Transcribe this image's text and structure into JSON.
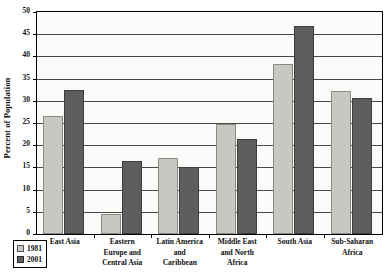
{
  "chart_data": {
    "type": "bar",
    "title": "",
    "xlabel": "",
    "ylabel": "Percent of Population",
    "ylim": [
      0,
      50
    ],
    "ytick_step": 5,
    "yticks": [
      0,
      5,
      10,
      15,
      20,
      25,
      30,
      35,
      40,
      45,
      50
    ],
    "ytick_labels": [
      "0",
      "5",
      "10",
      "15",
      "20",
      "25",
      "30",
      "35",
      "40",
      "45",
      "50"
    ],
    "grid": true,
    "legend_position": "bottom-left",
    "categories": [
      "East Asia",
      "Eastern Europe and Central Asia",
      "Latin America and Caribbean",
      "Middle East and North Africa",
      "South Asia",
      "Sub-Saharan Africa"
    ],
    "category_label_lines": [
      [
        "East Asia"
      ],
      [
        "Eastern",
        "Europe and",
        "Central Asia"
      ],
      [
        "Latin America",
        "and",
        "Caribbean"
      ],
      [
        "Middle East",
        "and North",
        "Africa"
      ],
      [
        "South Asia"
      ],
      [
        "Sub-Saharan",
        "Africa"
      ]
    ],
    "series": [
      {
        "name": "1981",
        "color": "#c8c8c2",
        "values": [
          26.5,
          4.5,
          17.2,
          24.8,
          38.3,
          32.3
        ]
      },
      {
        "name": "2001",
        "color": "#5e5e5e",
        "values": [
          32.5,
          16.4,
          15.2,
          21.3,
          46.8,
          30.7
        ]
      }
    ]
  },
  "legend": {
    "entries": [
      {
        "label": "1981"
      },
      {
        "label": "2001"
      }
    ]
  }
}
